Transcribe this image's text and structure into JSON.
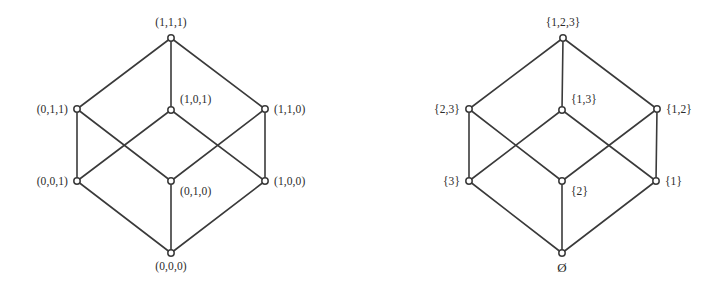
{
  "figure": {
    "background_color": "#ffffff",
    "line_color": "#3a3a3a",
    "text_color": "#2b2b2b",
    "node_fill": "#ffffff",
    "node_radius": 3.2,
    "width": 712,
    "height": 295
  },
  "chart_data": {
    "type": "diagram",
    "diagram_type": "hasse-diagram",
    "title": "",
    "panel_count": 2,
    "panels": [
      {
        "name": "bit-strings-cube",
        "description": "Hasse diagram of the partially ordered set of length-3 bit strings ordered by componentwise comparison",
        "nodes": [
          {
            "id": "L111",
            "label": "(1,1,1)",
            "x": 171,
            "y": 38,
            "label_x": 171,
            "label_y": 26,
            "label_anchor": "middle"
          },
          {
            "id": "L011",
            "label": "(0,1,1)",
            "x": 77,
            "y": 109,
            "label_x": 68,
            "label_y": 113,
            "label_anchor": "end"
          },
          {
            "id": "L101",
            "label": "(1,0,1)",
            "x": 171,
            "y": 110,
            "label_x": 180,
            "label_y": 103,
            "label_anchor": "start"
          },
          {
            "id": "L110",
            "label": "(1,1,0)",
            "x": 265,
            "y": 109,
            "label_x": 274,
            "label_y": 113,
            "label_anchor": "start"
          },
          {
            "id": "L001",
            "label": "(0,0,1)",
            "x": 77,
            "y": 181,
            "label_x": 68,
            "label_y": 185,
            "label_anchor": "end"
          },
          {
            "id": "L010",
            "label": "(0,1,0)",
            "x": 171,
            "y": 181,
            "label_x": 180,
            "label_y": 195,
            "label_anchor": "start"
          },
          {
            "id": "L100",
            "label": "(1,0,0)",
            "x": 265,
            "y": 181,
            "label_x": 274,
            "label_y": 185,
            "label_anchor": "start"
          },
          {
            "id": "L000",
            "label": "(0,0,0)",
            "x": 171,
            "y": 253,
            "label_x": 171,
            "label_y": 270,
            "label_anchor": "middle"
          }
        ],
        "edges": [
          [
            "L111",
            "L011"
          ],
          [
            "L111",
            "L101"
          ],
          [
            "L111",
            "L110"
          ],
          [
            "L011",
            "L001"
          ],
          [
            "L011",
            "L010"
          ],
          [
            "L101",
            "L001"
          ],
          [
            "L101",
            "L100"
          ],
          [
            "L110",
            "L010"
          ],
          [
            "L110",
            "L100"
          ],
          [
            "L001",
            "L000"
          ],
          [
            "L010",
            "L000"
          ],
          [
            "L100",
            "L000"
          ]
        ]
      },
      {
        "name": "power-set-cube",
        "description": "Hasse diagram of the power set of {1,2,3} ordered by inclusion",
        "nodes": [
          {
            "id": "R123",
            "label": "{1,2,3}",
            "x": 563,
            "y": 38,
            "label_x": 563,
            "label_y": 26,
            "label_anchor": "middle"
          },
          {
            "id": "R23",
            "label": "{2,3}",
            "x": 469,
            "y": 109,
            "label_x": 460,
            "label_y": 113,
            "label_anchor": "end"
          },
          {
            "id": "R13",
            "label": "{1,3}",
            "x": 562,
            "y": 110,
            "label_x": 571,
            "label_y": 103,
            "label_anchor": "start"
          },
          {
            "id": "R12",
            "label": "{1,2}",
            "x": 657,
            "y": 109,
            "label_x": 666,
            "label_y": 113,
            "label_anchor": "start"
          },
          {
            "id": "R3",
            "label": "{3}",
            "x": 469,
            "y": 181,
            "label_x": 460,
            "label_y": 185,
            "label_anchor": "end"
          },
          {
            "id": "R2",
            "label": "{2}",
            "x": 562,
            "y": 181,
            "label_x": 571,
            "label_y": 195,
            "label_anchor": "start"
          },
          {
            "id": "R1",
            "label": "{1}",
            "x": 656,
            "y": 181,
            "label_x": 665,
            "label_y": 185,
            "label_anchor": "start"
          },
          {
            "id": "R0",
            "label": "Ø",
            "x": 562,
            "y": 253,
            "label_x": 562,
            "label_y": 272,
            "label_anchor": "middle"
          }
        ],
        "edges": [
          [
            "R123",
            "R23"
          ],
          [
            "R123",
            "R13"
          ],
          [
            "R123",
            "R12"
          ],
          [
            "R23",
            "R3"
          ],
          [
            "R23",
            "R2"
          ],
          [
            "R13",
            "R3"
          ],
          [
            "R13",
            "R1"
          ],
          [
            "R12",
            "R2"
          ],
          [
            "R12",
            "R1"
          ],
          [
            "R3",
            "R0"
          ],
          [
            "R2",
            "R0"
          ],
          [
            "R1",
            "R0"
          ]
        ]
      }
    ]
  }
}
